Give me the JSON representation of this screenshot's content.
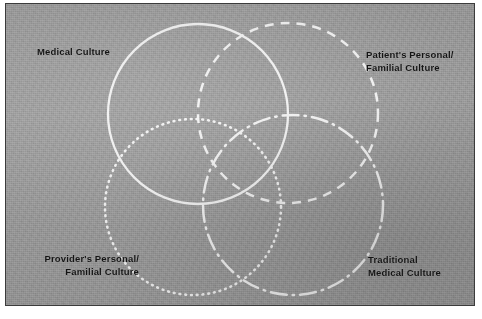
{
  "figure": {
    "background_color": "#9a9a9a",
    "border_color": "#3b3b3b",
    "stroke_color": "#f2f2f2",
    "label_color": "#141414"
  },
  "labels": {
    "medical": "Medical Culture",
    "patient": "Patient's Personal/\nFamilial Culture",
    "provider": "Provider's Personal/\nFamilial Culture",
    "traditional": "Traditional\nMedical Culture"
  },
  "chart_data": {
    "type": "diagram",
    "subtype": "venn-4-circle",
    "title": "",
    "sets": [
      {
        "name": "Medical Culture",
        "label": "Medical Culture",
        "line_style": "solid",
        "stroke": "#f2f2f2",
        "stroke_width": 2.3,
        "dash_array": "",
        "cx": 197,
        "cy": 113,
        "r": 90,
        "label_position": "top-left"
      },
      {
        "name": "Patient's Personal/Familial Culture",
        "label": "Patient's Personal/\nFamilial Culture",
        "line_style": "dashed",
        "stroke": "#f2f2f2",
        "stroke_width": 2.5,
        "dash_array": "9 7",
        "cx": 287,
        "cy": 112,
        "r": 90,
        "label_position": "top-right"
      },
      {
        "name": "Provider's Personal/Familial Culture",
        "label": "Provider's Personal/\nFamilial Culture",
        "line_style": "dotted",
        "stroke": "#f2f2f2",
        "stroke_width": 2.6,
        "dash_array": "0.8 5",
        "cx": 192,
        "cy": 206,
        "r": 88,
        "label_position": "bottom-left"
      },
      {
        "name": "Traditional Medical Culture",
        "label": "Traditional\nMedical Culture",
        "line_style": "dash-dot",
        "stroke": "#f2f2f2",
        "stroke_width": 2.5,
        "dash_array": "16 6 1.5 6",
        "cx": 292,
        "cy": 204,
        "r": 90,
        "label_position": "bottom-right"
      }
    ]
  }
}
